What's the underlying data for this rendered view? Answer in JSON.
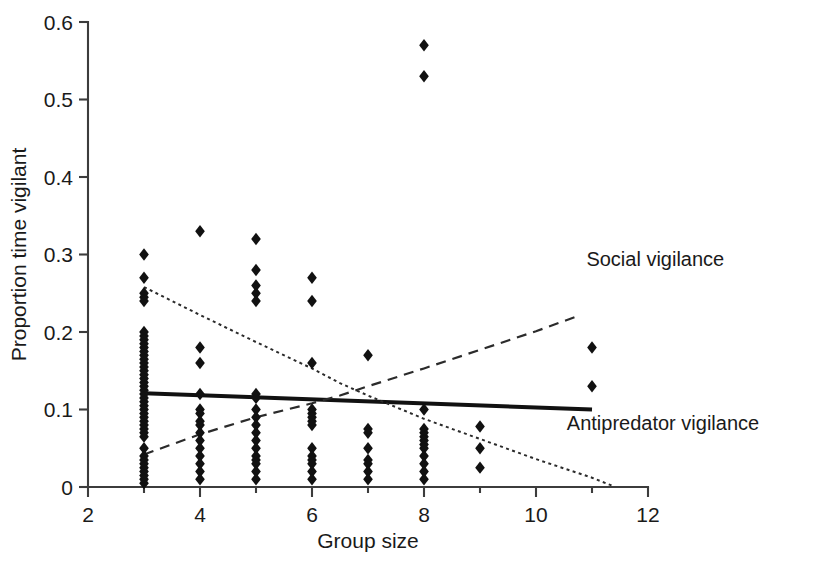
{
  "chart_data": {
    "type": "scatter",
    "title": "",
    "xlabel": "Group size",
    "ylabel": "Proportion time vigilant",
    "xlim": [
      2,
      12
    ],
    "ylim": [
      0,
      0.6
    ],
    "grid": false,
    "x_ticks": [
      "2",
      "4",
      "6",
      "8",
      "10",
      "12"
    ],
    "x_tick_values": [
      2,
      4,
      6,
      8,
      10,
      12
    ],
    "x_minor_tick_values": [
      3,
      5,
      7,
      9,
      11
    ],
    "y_ticks": [
      "0",
      "0.1",
      "0.2",
      "0.3",
      "0.4",
      "0.5",
      "0.6"
    ],
    "y_tick_values": [
      0,
      0.1,
      0.2,
      0.3,
      0.4,
      0.5,
      0.6
    ],
    "marker": "diamond",
    "marker_color": "#111111",
    "points": [
      {
        "x": 3,
        "y": 0.3
      },
      {
        "x": 3,
        "y": 0.27
      },
      {
        "x": 3,
        "y": 0.25
      },
      {
        "x": 3,
        "y": 0.245
      },
      {
        "x": 3,
        "y": 0.24
      },
      {
        "x": 3,
        "y": 0.2
      },
      {
        "x": 3,
        "y": 0.195
      },
      {
        "x": 3,
        "y": 0.19
      },
      {
        "x": 3,
        "y": 0.185
      },
      {
        "x": 3,
        "y": 0.18
      },
      {
        "x": 3,
        "y": 0.175
      },
      {
        "x": 3,
        "y": 0.17
      },
      {
        "x": 3,
        "y": 0.165
      },
      {
        "x": 3,
        "y": 0.16
      },
      {
        "x": 3,
        "y": 0.155
      },
      {
        "x": 3,
        "y": 0.15
      },
      {
        "x": 3,
        "y": 0.145
      },
      {
        "x": 3,
        "y": 0.14
      },
      {
        "x": 3,
        "y": 0.135
      },
      {
        "x": 3,
        "y": 0.13
      },
      {
        "x": 3,
        "y": 0.125
      },
      {
        "x": 3,
        "y": 0.12
      },
      {
        "x": 3,
        "y": 0.115
      },
      {
        "x": 3,
        "y": 0.11
      },
      {
        "x": 3,
        "y": 0.105
      },
      {
        "x": 3,
        "y": 0.1
      },
      {
        "x": 3,
        "y": 0.095
      },
      {
        "x": 3,
        "y": 0.09
      },
      {
        "x": 3,
        "y": 0.085
      },
      {
        "x": 3,
        "y": 0.08
      },
      {
        "x": 3,
        "y": 0.075
      },
      {
        "x": 3,
        "y": 0.07
      },
      {
        "x": 3,
        "y": 0.065
      },
      {
        "x": 3,
        "y": 0.05
      },
      {
        "x": 3,
        "y": 0.04
      },
      {
        "x": 3,
        "y": 0.035
      },
      {
        "x": 3,
        "y": 0.03
      },
      {
        "x": 3,
        "y": 0.025
      },
      {
        "x": 3,
        "y": 0.02
      },
      {
        "x": 3,
        "y": 0.015
      },
      {
        "x": 3,
        "y": 0.01
      },
      {
        "x": 3,
        "y": 0.005
      },
      {
        "x": 4,
        "y": 0.33
      },
      {
        "x": 4,
        "y": 0.18
      },
      {
        "x": 4,
        "y": 0.16
      },
      {
        "x": 4,
        "y": 0.12
      },
      {
        "x": 4,
        "y": 0.1
      },
      {
        "x": 4,
        "y": 0.095
      },
      {
        "x": 4,
        "y": 0.085
      },
      {
        "x": 4,
        "y": 0.08
      },
      {
        "x": 4,
        "y": 0.07
      },
      {
        "x": 4,
        "y": 0.06
      },
      {
        "x": 4,
        "y": 0.05
      },
      {
        "x": 4,
        "y": 0.04
      },
      {
        "x": 4,
        "y": 0.03
      },
      {
        "x": 4,
        "y": 0.02
      },
      {
        "x": 4,
        "y": 0.01
      },
      {
        "x": 5,
        "y": 0.32
      },
      {
        "x": 5,
        "y": 0.28
      },
      {
        "x": 5,
        "y": 0.26
      },
      {
        "x": 5,
        "y": 0.25
      },
      {
        "x": 5,
        "y": 0.24
      },
      {
        "x": 5,
        "y": 0.12
      },
      {
        "x": 5,
        "y": 0.115
      },
      {
        "x": 5,
        "y": 0.1
      },
      {
        "x": 5,
        "y": 0.09
      },
      {
        "x": 5,
        "y": 0.08
      },
      {
        "x": 5,
        "y": 0.07
      },
      {
        "x": 5,
        "y": 0.06
      },
      {
        "x": 5,
        "y": 0.05
      },
      {
        "x": 5,
        "y": 0.04
      },
      {
        "x": 5,
        "y": 0.035
      },
      {
        "x": 5,
        "y": 0.03
      },
      {
        "x": 5,
        "y": 0.02
      },
      {
        "x": 5,
        "y": 0.01
      },
      {
        "x": 6,
        "y": 0.27
      },
      {
        "x": 6,
        "y": 0.24
      },
      {
        "x": 6,
        "y": 0.16
      },
      {
        "x": 6,
        "y": 0.1
      },
      {
        "x": 6,
        "y": 0.095
      },
      {
        "x": 6,
        "y": 0.09
      },
      {
        "x": 6,
        "y": 0.085
      },
      {
        "x": 6,
        "y": 0.08
      },
      {
        "x": 6,
        "y": 0.05
      },
      {
        "x": 6,
        "y": 0.04
      },
      {
        "x": 6,
        "y": 0.035
      },
      {
        "x": 6,
        "y": 0.03
      },
      {
        "x": 6,
        "y": 0.02
      },
      {
        "x": 6,
        "y": 0.01
      },
      {
        "x": 7,
        "y": 0.17
      },
      {
        "x": 7,
        "y": 0.075
      },
      {
        "x": 7,
        "y": 0.07
      },
      {
        "x": 7,
        "y": 0.05
      },
      {
        "x": 7,
        "y": 0.035
      },
      {
        "x": 7,
        "y": 0.03
      },
      {
        "x": 7,
        "y": 0.02
      },
      {
        "x": 7,
        "y": 0.01
      },
      {
        "x": 8,
        "y": 0.57
      },
      {
        "x": 8,
        "y": 0.53
      },
      {
        "x": 8,
        "y": 0.1
      },
      {
        "x": 8,
        "y": 0.075
      },
      {
        "x": 8,
        "y": 0.07
      },
      {
        "x": 8,
        "y": 0.065
      },
      {
        "x": 8,
        "y": 0.06
      },
      {
        "x": 8,
        "y": 0.055
      },
      {
        "x": 8,
        "y": 0.05
      },
      {
        "x": 8,
        "y": 0.04
      },
      {
        "x": 8,
        "y": 0.03
      },
      {
        "x": 8,
        "y": 0.02
      },
      {
        "x": 8,
        "y": 0.01
      },
      {
        "x": 9,
        "y": 0.078
      },
      {
        "x": 9,
        "y": 0.05
      },
      {
        "x": 9,
        "y": 0.025
      },
      {
        "x": 11,
        "y": 0.18
      },
      {
        "x": 11,
        "y": 0.13
      }
    ],
    "fits": [
      {
        "name": "total-vigilance",
        "style": "solid",
        "label": "",
        "points": [
          [
            3,
            0.121
          ],
          [
            11,
            0.1
          ]
        ]
      },
      {
        "name": "antipredator-vigilance",
        "style": "dotted",
        "label": "Antipredator vigilance",
        "points": [
          [
            3,
            0.258
          ],
          [
            4,
            0.222
          ],
          [
            5,
            0.187
          ],
          [
            6,
            0.153
          ],
          [
            6.5,
            0.134
          ],
          [
            7,
            0.118
          ],
          [
            8,
            0.088
          ],
          [
            9,
            0.062
          ],
          [
            10,
            0.036
          ],
          [
            11,
            0.012
          ],
          [
            11.35,
            0.002
          ]
        ]
      },
      {
        "name": "social-vigilance",
        "style": "dashed",
        "label": "Social vigilance",
        "points": [
          [
            3,
            0.042
          ],
          [
            4,
            0.068
          ],
          [
            5,
            0.09
          ],
          [
            6,
            0.108
          ],
          [
            6.5,
            0.118
          ],
          [
            7,
            0.13
          ],
          [
            8,
            0.153
          ],
          [
            9,
            0.177
          ],
          [
            10,
            0.201
          ],
          [
            10.8,
            0.222
          ]
        ]
      }
    ],
    "annotations": [
      {
        "name": "social-vigilance-label",
        "text": "Social vigilance",
        "x": 10.9,
        "y": 0.285
      },
      {
        "name": "antipredator-vigilance-label",
        "text": "Antipredator vigilance",
        "x": 10.55,
        "y": 0.073
      }
    ]
  }
}
